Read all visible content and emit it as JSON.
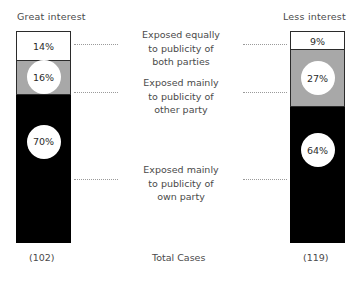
{
  "chart_data": {
    "type": "bar",
    "subtype": "stacked-100-percent",
    "title": "",
    "xlabel": "Total Cases",
    "ylabel": "",
    "ylim": [
      0,
      100
    ],
    "grid": false,
    "legend_position": "center-between-bars",
    "categories": [
      "Great interest",
      "Less interest"
    ],
    "totals": [
      102,
      119
    ],
    "total_labels": [
      "(102)",
      "(119)"
    ],
    "series": [
      {
        "name": "Exposed equally to publicity of both parties",
        "values": [
          14,
          9
        ],
        "value_labels": [
          "14%",
          "9%"
        ],
        "color": "#ffffff",
        "label_lines": [
          "Exposed equally",
          "to publicity of",
          "both parties"
        ]
      },
      {
        "name": "Exposed mainly to publicity of other party",
        "values": [
          16,
          27
        ],
        "value_labels": [
          "16%",
          "27%"
        ],
        "color": "#a8a8a8",
        "label_lines": [
          "Exposed mainly",
          "to publicity of",
          "other party"
        ]
      },
      {
        "name": "Exposed mainly to publicity of own party",
        "values": [
          70,
          64
        ],
        "value_labels": [
          "70%",
          "64%"
        ],
        "color": "#000000",
        "label_lines": [
          "Exposed mainly",
          "to publicity of",
          "own party"
        ]
      }
    ]
  },
  "headers": {
    "left": "Great interest",
    "right": "Less interest"
  },
  "footer": {
    "left_total": "(102)",
    "axis_caption": "Total Cases",
    "right_total": "(119)"
  },
  "annotations": [
    {
      "line1": "Exposed equally",
      "line2": "to publicity of",
      "line3": "both parties"
    },
    {
      "line1": "Exposed mainly",
      "line2": "to publicity of",
      "line3": "other party"
    },
    {
      "line1": "Exposed mainly",
      "line2": "to publicity of",
      "line3": "own party"
    }
  ],
  "colors": {
    "segment_equal": "#ffffff",
    "segment_other": "#a8a8a8",
    "segment_own": "#000000",
    "outline": "#2b2b2b",
    "leader_line": "#9a9a9a",
    "text": "#4a4a4a"
  }
}
